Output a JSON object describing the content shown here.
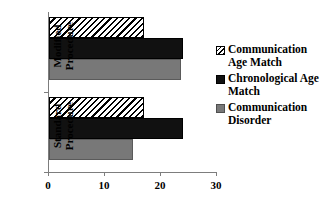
{
  "chart_data": {
    "type": "bar",
    "orientation": "horizontal",
    "title": "",
    "xlabel": "",
    "ylabel": "",
    "categories": [
      "Modified Procedure",
      "Standard Procedure"
    ],
    "series": [
      {
        "name": "Communication Age Match",
        "style": "hatched",
        "values": [
          17,
          17
        ]
      },
      {
        "name": "Chronological Age Match",
        "style": "solid-black",
        "values": [
          24,
          24
        ]
      },
      {
        "name": "Communication Disorder",
        "style": "solid-gray",
        "values": [
          23.5,
          15
        ]
      }
    ],
    "xlim": [
      0,
      30
    ],
    "xticks": [
      0,
      10,
      20,
      30
    ],
    "xtick_labels": [
      "0",
      "10",
      "20",
      "30"
    ],
    "grid": false,
    "legend_position": "right"
  },
  "axis": {
    "ticks": [
      {
        "label": "0",
        "value": 0
      },
      {
        "label": "10",
        "value": 10
      },
      {
        "label": "20",
        "value": 20
      },
      {
        "label": "30",
        "value": 30
      }
    ]
  },
  "categories": {
    "modified": "Modified\nProcedure",
    "standard": "Standard\nProcedure"
  },
  "legend": {
    "items": [
      {
        "label": "Communication\nAge Match",
        "swatch": "hatched-swatch-icon"
      },
      {
        "label": "Chronological Age\nMatch",
        "swatch": "black-swatch-icon"
      },
      {
        "label": "Communication\nDisorder",
        "swatch": "gray-swatch-icon"
      }
    ]
  },
  "colors": {
    "black": "#111111",
    "gray": "#787878",
    "hatch_line": "#000000",
    "axis": "#7d7d7d",
    "background": "#ffffff"
  }
}
